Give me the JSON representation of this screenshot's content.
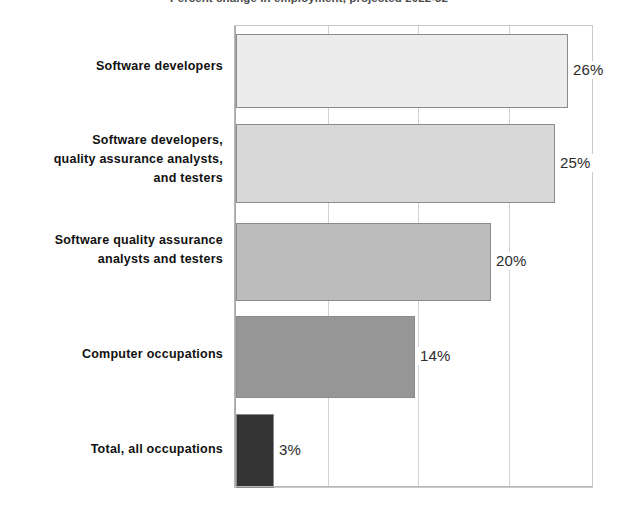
{
  "chart_data": {
    "type": "bar",
    "orientation": "horizontal",
    "title": "Percent change in employment, projected 2022-32",
    "xlabel": "",
    "ylabel": "",
    "categories": [
      "Software developers",
      "Software developers, quality assurance analysts, and testers",
      "Software quality assurance analysts and testers",
      "Computer occupations",
      "Total, all occupations"
    ],
    "values": [
      26,
      25,
      20,
      14,
      3
    ],
    "value_labels": [
      "26%",
      "25%",
      "20%",
      "14%",
      "3%"
    ],
    "xlim": [
      0,
      28
    ],
    "xticks": [
      0,
      7,
      14,
      21,
      28
    ],
    "grid": true,
    "legend": "none",
    "bar_colors": [
      "#ececec",
      "#d8d8d8",
      "#bcbcbc",
      "#969696",
      "#333333"
    ]
  },
  "categories_wrapped": [
    [
      "Software developers"
    ],
    [
      "Software developers,",
      "quality assurance analysts,",
      "and testers"
    ],
    [
      "Software quality assurance",
      "analysts and testers"
    ],
    [
      "Computer occupations"
    ],
    [
      "Total, all occupations"
    ]
  ],
  "axis": {
    "tick_labels": [
      "",
      "",
      "",
      "",
      ""
    ]
  }
}
